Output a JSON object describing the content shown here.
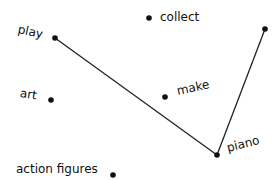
{
  "diagram": {
    "nodes": [
      {
        "id": "play",
        "label": "play",
        "x": 55,
        "y": 38,
        "lx": 18,
        "ly": 22,
        "rot": 12
      },
      {
        "id": "collect",
        "label": "collect",
        "x": 149,
        "y": 18,
        "lx": 160,
        "ly": 10,
        "rot": 0
      },
      {
        "id": "top-right",
        "label": "",
        "x": 265,
        "y": 29,
        "lx": 0,
        "ly": 0,
        "rot": 0
      },
      {
        "id": "art",
        "label": "art",
        "x": 51,
        "y": 100,
        "lx": 20,
        "ly": 86,
        "rot": 8
      },
      {
        "id": "make",
        "label": "make",
        "x": 165,
        "y": 97,
        "lx": 177,
        "ly": 84,
        "rot": -12
      },
      {
        "id": "piano",
        "label": "piano",
        "x": 217,
        "y": 155,
        "lx": 227,
        "ly": 141,
        "rot": -14
      },
      {
        "id": "action-figures",
        "label": "action figures",
        "x": 113,
        "y": 175,
        "lx": 16,
        "ly": 162,
        "rot": 0
      }
    ],
    "edges": [
      {
        "from": "play",
        "to": "piano"
      },
      {
        "from": "piano",
        "to": "top-right"
      }
    ]
  }
}
